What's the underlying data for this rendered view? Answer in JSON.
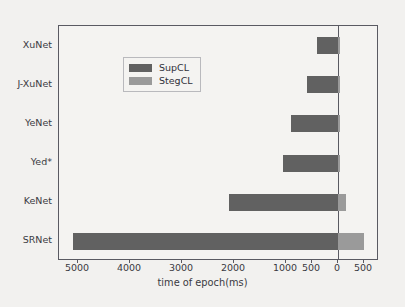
{
  "chart_data": {
    "type": "bar",
    "orientation": "horizontal",
    "title": "",
    "xlabel": "time of epoch(ms)",
    "ylabel": "",
    "categories": [
      "XuNet",
      "J-XuNet",
      "YeNet",
      "Yed*",
      "KeNet",
      "SRNet"
    ],
    "series": [
      {
        "name": "SupCL",
        "color": "#616161",
        "direction": "left",
        "values": [
          400,
          600,
          900,
          1050,
          2100,
          5100
        ]
      },
      {
        "name": "StegCL",
        "color": "#9a9a9a",
        "direction": "right",
        "values": [
          30,
          30,
          30,
          40,
          160,
          500
        ]
      }
    ],
    "xticks": [
      {
        "label": "5000",
        "value": -5000
      },
      {
        "label": "4000",
        "value": -4000
      },
      {
        "label": "3000",
        "value": -3000
      },
      {
        "label": "2000",
        "value": -2000
      },
      {
        "label": "1000",
        "value": -1000
      },
      {
        "label": "500",
        "value": -500
      },
      {
        "label": "0",
        "value": 0
      },
      {
        "label": "500",
        "value": 500
      }
    ],
    "xlim": [
      -5200,
      600
    ],
    "grid": false,
    "zero_reference_line": true,
    "legend_position": "upper left"
  },
  "legend": {
    "entries": [
      {
        "label": "SupCL"
      },
      {
        "label": "StegCL"
      }
    ]
  },
  "axis": {
    "x_title": "time of epoch(ms)"
  },
  "colors": {
    "supcl": "#616161",
    "stegcl": "#9a9a9a",
    "frame": "#5a5a62",
    "background": "#f2f1ef",
    "text": "#3a3a42"
  }
}
